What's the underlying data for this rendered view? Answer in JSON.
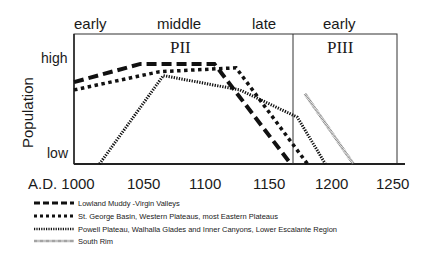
{
  "chart_data": {
    "type": "line",
    "title": "",
    "xlabel": "",
    "ylabel": "Population",
    "x_axis_prefix": "A.D.",
    "xlim": [
      1000,
      1250
    ],
    "x_ticks": [
      1000,
      1050,
      1100,
      1150,
      1200,
      1250
    ],
    "y_ticks": [
      "low",
      "high"
    ],
    "ylim": [
      0,
      100
    ],
    "grid": false,
    "periods": [
      {
        "name": "PII",
        "range": [
          1000,
          1170
        ],
        "subperiods": [
          "early",
          "middle",
          "late"
        ]
      },
      {
        "name": "PIII",
        "range": [
          1170,
          1250
        ],
        "subperiods": [
          "early"
        ]
      }
    ],
    "legend_position": "bottom",
    "series": [
      {
        "name": "Lowland Muddy -Virgin Valleys",
        "style": "long-dash",
        "points": [
          [
            1000,
            63
          ],
          [
            1052,
            77
          ],
          [
            1110,
            77
          ],
          [
            1170,
            0
          ]
        ]
      },
      {
        "name": "St. George Basin, Western Plateaus, most Eastern Plateaus",
        "style": "square-dot",
        "points": [
          [
            1000,
            57
          ],
          [
            1067,
            71
          ],
          [
            1127,
            74
          ],
          [
            1183,
            0
          ]
        ]
      },
      {
        "name": "Powell Plateau, Walhalla Glades and Inner Canyons, Lower Escalante Region",
        "style": "fine-dot",
        "points": [
          [
            1020,
            0
          ],
          [
            1070,
            68
          ],
          [
            1130,
            57
          ],
          [
            1175,
            36
          ],
          [
            1197,
            0
          ]
        ]
      },
      {
        "name": "South Rim",
        "style": "hatched",
        "points": [
          [
            1181,
            54
          ],
          [
            1219,
            0
          ]
        ]
      }
    ]
  },
  "labels": {
    "top": {
      "early1": "early",
      "middle": "middle",
      "late": "late",
      "early2": "early"
    },
    "period1": "PII",
    "period2": "PIII",
    "y_high": "high",
    "y_low": "low",
    "y_title": "Population",
    "x_first": "A.D. 1000",
    "x1050": "1050",
    "x1100": "1100",
    "x1150": "1150",
    "x1200": "1200",
    "x1250": "1250"
  },
  "legend": [
    {
      "label": "Lowland Muddy -Virgin Valleys"
    },
    {
      "label": "St. George Basin, Western Plateaus, most Eastern Plateaus"
    },
    {
      "label": "Powell Plateau, Walhalla Glades and Inner Canyons, Lower Escalante Region"
    },
    {
      "label": "South Rim"
    }
  ]
}
